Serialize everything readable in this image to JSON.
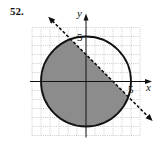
{
  "problem": {
    "number": "52."
  },
  "chart_data": {
    "type": "region-plot",
    "title": "",
    "xlabel": "x",
    "ylabel": "y",
    "xlim": [
      -6,
      6
    ],
    "ylim": [
      -6,
      6
    ],
    "grid": true,
    "grid_style": "dotted",
    "tick_labels": {
      "x": [
        "5"
      ],
      "y": [
        "5"
      ]
    },
    "tick_values": {
      "x": [
        5
      ],
      "y": [
        5
      ]
    },
    "circle": {
      "center": [
        0,
        0
      ],
      "radius": 5,
      "style": "solid",
      "equation": "x^2 + y^2 = 25"
    },
    "line": {
      "equation": "x + y = 3",
      "points": [
        [
          -6,
          9
        ],
        [
          9,
          -6
        ]
      ],
      "style": "dashed",
      "arrows": "both"
    },
    "shaded_region": {
      "description": "inside circle and below/left of dashed line",
      "inequalities": [
        "x^2 + y^2 <= 25",
        "x + y < 3"
      ],
      "fill": "#8c8c8c"
    }
  },
  "colors": {
    "shade": "#8c8c8c",
    "stroke": "#111111",
    "grid": "#b5b5b5"
  }
}
